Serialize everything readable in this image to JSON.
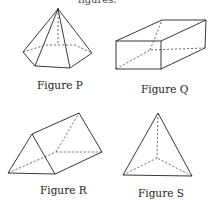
{
  "header": {
    "cut_text": "figures."
  },
  "figures": [
    {
      "id": "P",
      "label": "Figure P",
      "shape": "hexagonal pyramid"
    },
    {
      "id": "Q",
      "label": "Figure Q",
      "shape": "rectangular prism"
    },
    {
      "id": "R",
      "label": "Figure R",
      "shape": "triangular prism"
    },
    {
      "id": "S",
      "label": "Figure S",
      "shape": "triangular pyramid"
    }
  ]
}
